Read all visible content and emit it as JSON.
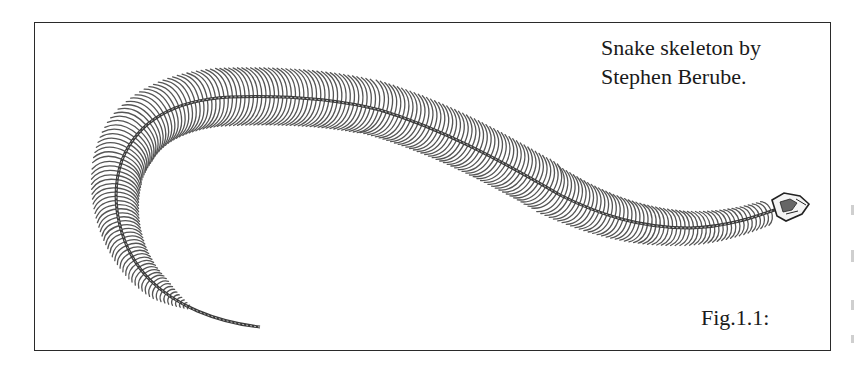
{
  "figure": {
    "credit_line1": "Snake skeleton by",
    "credit_line2": "Stephen Berube.",
    "label": "Fig.1.1:"
  },
  "colors": {
    "ink": "#2a2a2a",
    "rib": "#555555",
    "background": "#ffffff"
  }
}
